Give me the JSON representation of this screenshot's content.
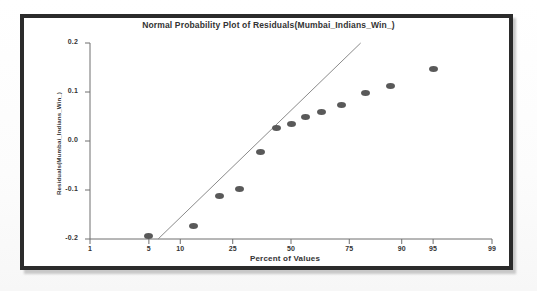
{
  "figure": {
    "border_color": "#2b2b2b",
    "background": "#ffffff",
    "marker_color": "#595959",
    "axis_color": "#6e6e6e"
  },
  "chart_data": {
    "type": "scatter",
    "title": "Normal Probability Plot of Residuals(Mumbai_Indians_Win_)",
    "xlabel": "Percent of Values",
    "ylabel": "Residuals(Mumbai_Indians_Win_)",
    "x_scale": "normal-probability",
    "xticks": [
      1,
      5,
      10,
      25,
      50,
      75,
      90,
      95,
      99
    ],
    "xtick_labels": [
      "1",
      "5",
      "10",
      "25",
      "50",
      "75",
      "90",
      "95",
      "99"
    ],
    "yticks": [
      -0.2,
      -0.1,
      0.0,
      0.1,
      0.2
    ],
    "ytick_labels": [
      "-0.2",
      "-0.1",
      "0.0",
      "0.1",
      "0.2"
    ],
    "xlim": [
      1,
      99
    ],
    "ylim": [
      -0.2,
      0.2
    ],
    "grid": false,
    "legend": null,
    "points": [
      {
        "percent": 5.0,
        "residual": -0.193
      },
      {
        "percent": 13.0,
        "residual": -0.174
      },
      {
        "percent": 20.5,
        "residual": -0.112
      },
      {
        "percent": 27.5,
        "residual": -0.098
      },
      {
        "percent": 36.0,
        "residual": -0.022
      },
      {
        "percent": 43.5,
        "residual": 0.026
      },
      {
        "percent": 50.0,
        "residual": 0.035
      },
      {
        "percent": 56.5,
        "residual": 0.05
      },
      {
        "percent": 64.0,
        "residual": 0.06
      },
      {
        "percent": 72.0,
        "residual": 0.073
      },
      {
        "percent": 80.5,
        "residual": 0.098
      },
      {
        "percent": 87.5,
        "residual": 0.113
      },
      {
        "percent": 95.0,
        "residual": 0.146
      }
    ],
    "reference_line": {
      "style": "solid",
      "color": "#8a8a8a",
      "from": {
        "percent": 6.2,
        "residual": -0.2
      },
      "to": {
        "percent": 79.0,
        "residual": 0.2
      }
    }
  }
}
